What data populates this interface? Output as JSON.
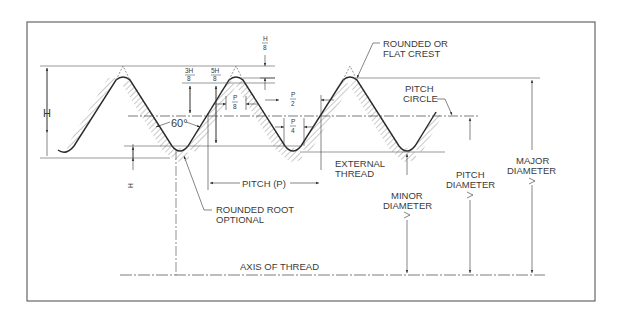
{
  "diagram": {
    "type": "technical-drawing",
    "labels": {
      "crest": [
        "ROUNDED OR",
        "FLAT CREST"
      ],
      "pitch_circle": [
        "PITCH",
        "CIRCLE"
      ],
      "height": "H",
      "angle": "60°",
      "h8_num": "H",
      "h8_den": "8",
      "three_h8_num": "3H",
      "three_h8_den": "8",
      "five_h8_num": "5H",
      "five_h8_den": "8",
      "p8_num": "P",
      "p8_den": "8",
      "p2_num": "P",
      "p2_den": "2",
      "p4_num": "P",
      "p4_den": "4",
      "h4_num": "H",
      "h4_den": "4",
      "pitch": "PITCH (P)",
      "external_thread": [
        "EXTERNAL",
        "THREAD"
      ],
      "rounded_root": [
        "ROUNDED ROOT",
        "OPTIONAL"
      ],
      "minor_diameter": [
        "MINOR",
        "DIAMETER"
      ],
      "pitch_diameter": [
        "PITCH",
        "DIAMETER"
      ],
      "major_diameter": [
        "MAJOR",
        "DIAMETER"
      ],
      "axis": "AXIS OF THREAD"
    },
    "colors": {
      "line": "#2a2a2a",
      "thin": "#555555",
      "hatch": "#777777",
      "border": "#666666"
    }
  }
}
